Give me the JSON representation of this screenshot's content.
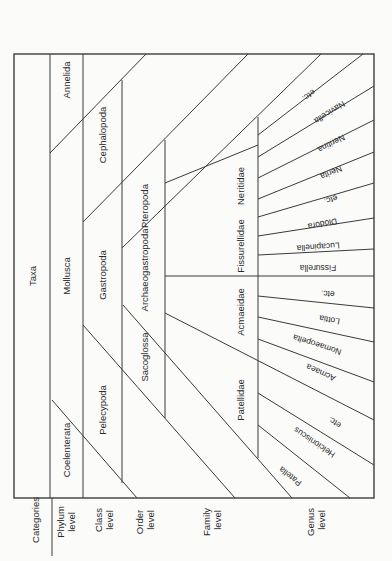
{
  "header": {
    "taxa": "Taxa",
    "categories": "Categories"
  },
  "levels": [
    {
      "line1": "Phylum",
      "line2": "level"
    },
    {
      "line1": "Class",
      "line2": "level"
    },
    {
      "line1": "Order",
      "line2": "level"
    },
    {
      "line1": "Family",
      "line2": "level"
    },
    {
      "line1": "Genus",
      "line2": "level"
    }
  ],
  "phylum": [
    "Annelida",
    "Mollusca",
    "Coelenterata"
  ],
  "class": [
    "Cephalopoda",
    "Gastropoda",
    "Pelecypoda"
  ],
  "order": [
    "Pteropoda",
    "Archaeogastropoda",
    "Sacoglossa"
  ],
  "family": [
    "Neritidae",
    "Fissurellidae",
    "Acmaeidae",
    "Patellidae"
  ],
  "genus": [
    "etc.",
    "Navicella",
    "Neritina",
    "Nerita",
    "etc.",
    "Diodora",
    "Lucapinella",
    "Fissurella",
    "etc.",
    "Lottia",
    "Nomaeopelta",
    "Acmaea",
    "etc.",
    "Helcioniscus",
    "Patella"
  ],
  "colors": {
    "line": "#3a3a3a",
    "background": "#fbfbfa",
    "text": "#2a2a2a"
  }
}
